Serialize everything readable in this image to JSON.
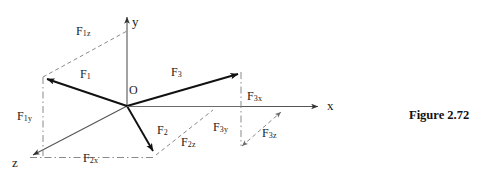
{
  "figure": {
    "caption": "Figure 2.72",
    "origin_label": "O",
    "axes": [
      {
        "name": "y",
        "label": "y"
      },
      {
        "name": "x",
        "label": "x"
      },
      {
        "name": "z",
        "label": "z"
      }
    ],
    "force_labels": [
      {
        "name": "F1",
        "base": "F",
        "sub": "1"
      },
      {
        "name": "F1z",
        "base": "F",
        "sub": "1z"
      },
      {
        "name": "F1y",
        "base": "F",
        "sub": "1y"
      },
      {
        "name": "F2",
        "base": "F",
        "sub": "2"
      },
      {
        "name": "F2x",
        "base": "F",
        "sub": "2x"
      },
      {
        "name": "F2z",
        "base": "F",
        "sub": "2z"
      },
      {
        "name": "F3",
        "base": "F",
        "sub": "3"
      },
      {
        "name": "F3x",
        "base": "F",
        "sub": "3x"
      },
      {
        "name": "F3y",
        "base": "F",
        "sub": "3y"
      },
      {
        "name": "F3z",
        "base": "F",
        "sub": "3z"
      }
    ],
    "colors": {
      "vector_stroke": "#111111",
      "axis_stroke": "#555555",
      "construction_stroke": "#8a8a8a",
      "text": "#1a1a1a",
      "background": "#ffffff"
    }
  }
}
